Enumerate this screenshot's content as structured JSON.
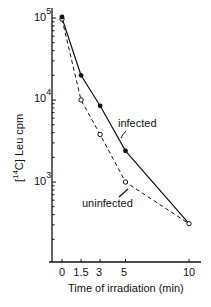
{
  "chart_data": {
    "type": "line",
    "title": "",
    "xlabel": "Time of irradiation (min)",
    "ylabel": "[14C] Leu cpm",
    "yscale": "log",
    "ylim": [
      150,
      100000
    ],
    "xlim": [
      -1,
      11
    ],
    "x_ticks": [
      "0",
      "1.5",
      "3",
      "5",
      "10"
    ],
    "y_ticks": [
      "10^5",
      "10^4",
      "10^3"
    ],
    "x": [
      0,
      1.5,
      3,
      5,
      10
    ],
    "series": [
      {
        "name": "infected",
        "marker": "filled-circle",
        "line": "solid",
        "values": [
          100000,
          20000,
          8500,
          2400,
          310
        ]
      },
      {
        "name": "uninfected",
        "marker": "open-circle",
        "line": "dashed",
        "values": [
          97000,
          10000,
          3800,
          1000,
          310
        ]
      }
    ],
    "grid": false,
    "legend": "inline annotations"
  },
  "labels": {
    "ylabel_prefix": "[",
    "ylabel_sup": "14",
    "ylabel_rest": "C] Leu  cpm",
    "xlabel": "Time of irradiation (min)",
    "ann_infected": "infected",
    "ann_uninfected": "uninfected",
    "yticks": [
      {
        "base": "10",
        "exp": "5"
      },
      {
        "base": "10",
        "exp": "4"
      },
      {
        "base": "10",
        "exp": "3"
      }
    ],
    "xticks": [
      "0",
      "1.5",
      "3",
      "5",
      "10"
    ]
  }
}
